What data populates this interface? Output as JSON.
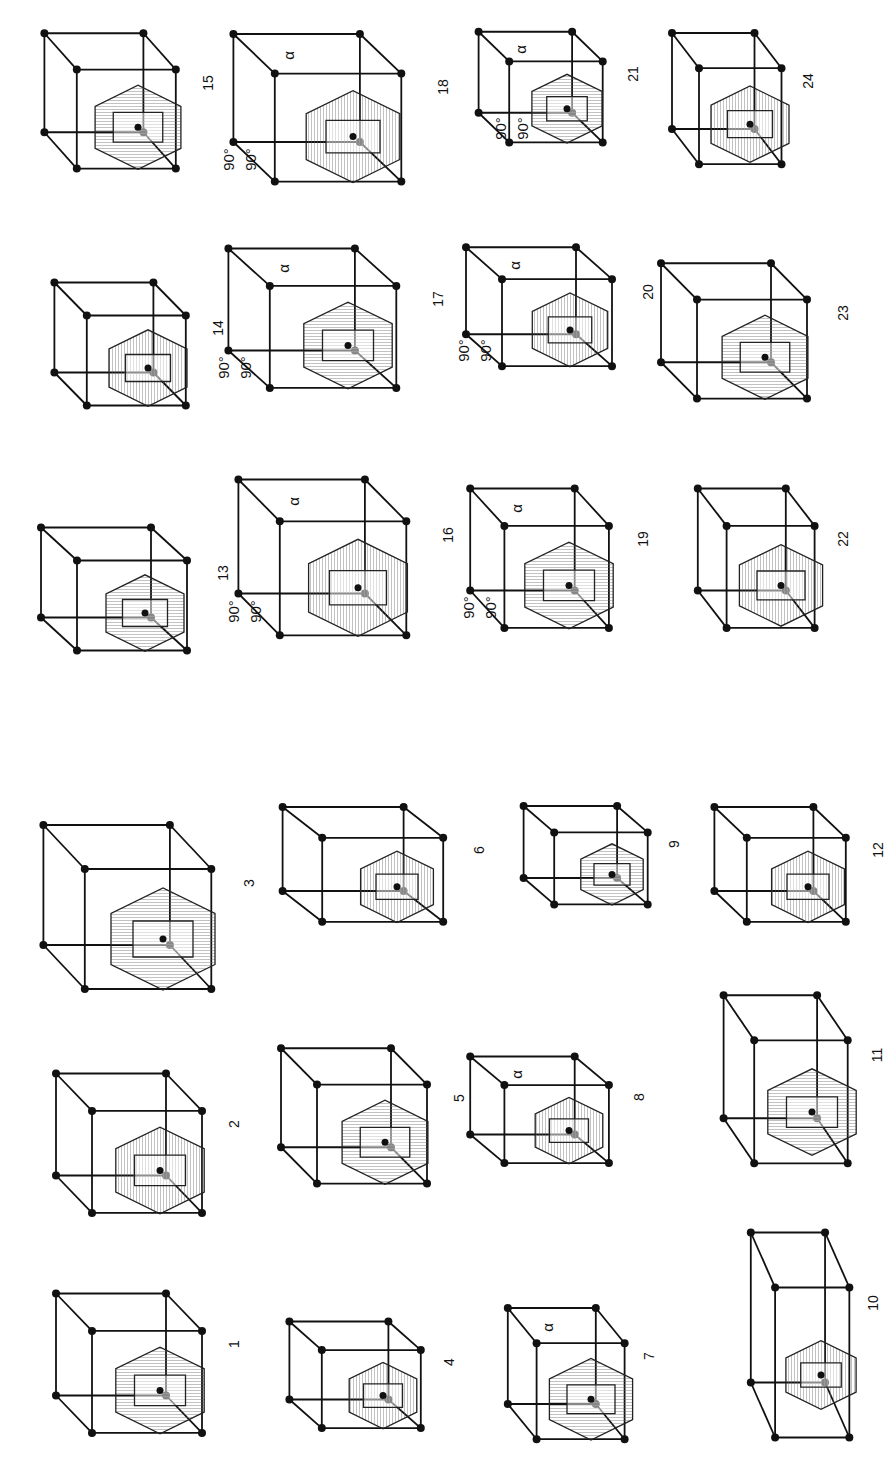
{
  "figure": {
    "orientation": "rotated 90 degrees counter-clockwise",
    "panels": [
      {
        "id": "1",
        "label": "1",
        "x": 40,
        "y": 1285,
        "w": 200,
        "h": 170,
        "kind": "cubic-bcc-truncated-octahedron",
        "angles": []
      },
      {
        "id": "2",
        "label": "2",
        "x": 40,
        "y": 1065,
        "w": 200,
        "h": 170,
        "kind": "cubic-fcc-rhombic-dodecahedron",
        "angles": []
      },
      {
        "id": "3",
        "label": "3",
        "x": 25,
        "y": 815,
        "w": 230,
        "h": 200,
        "kind": "cubic-primitive-cube",
        "angles": []
      },
      {
        "id": "4",
        "label": "4",
        "x": 275,
        "y": 1315,
        "w": 180,
        "h": 130,
        "kind": "tetragonal-primitive",
        "angles": []
      },
      {
        "id": "5",
        "label": "5",
        "x": 265,
        "y": 1040,
        "w": 200,
        "h": 165,
        "kind": "tetragonal-body-centered",
        "angles": []
      },
      {
        "id": "6",
        "label": "6",
        "x": 265,
        "y": 800,
        "w": 220,
        "h": 140,
        "kind": "hexagonal-centered",
        "angles": []
      },
      {
        "id": "7",
        "label": "7",
        "x": 495,
        "y": 1300,
        "w": 160,
        "h": 160,
        "kind": "rhombohedral",
        "angles": [
          "α"
        ]
      },
      {
        "id": "8",
        "label": "8",
        "x": 455,
        "y": 1050,
        "w": 190,
        "h": 130,
        "kind": "rhombohedral-primitive",
        "angles": [
          "α"
        ]
      },
      {
        "id": "9",
        "label": "9",
        "x": 510,
        "y": 800,
        "w": 170,
        "h": 120,
        "kind": "hexagonal-primitive",
        "angles": []
      },
      {
        "id": "10",
        "label": "10",
        "x": 740,
        "y": 1220,
        "w": 135,
        "h": 250,
        "kind": "orthorhombic-face-centered",
        "angles": []
      },
      {
        "id": "11",
        "label": "11",
        "x": 710,
        "y": 985,
        "w": 170,
        "h": 205,
        "kind": "orthorhombic-body-centered",
        "angles": []
      },
      {
        "id": "12",
        "label": "12",
        "x": 700,
        "y": 800,
        "w": 180,
        "h": 140,
        "kind": "orthorhombic-base-centered",
        "angles": []
      },
      {
        "id": "13",
        "label": "13",
        "x": 25,
        "y": 520,
        "w": 200,
        "h": 150,
        "kind": "orthorhombic-dodecahedron",
        "angles": []
      },
      {
        "id": "14",
        "label": "14",
        "x": 40,
        "y": 275,
        "w": 180,
        "h": 150,
        "kind": "orthorhombic-primitive",
        "angles": []
      },
      {
        "id": "15",
        "label": "15",
        "x": 30,
        "y": 25,
        "w": 180,
        "h": 165,
        "kind": "orthorhombic-brick",
        "angles": []
      },
      {
        "id": "16",
        "label": "16",
        "x": 220,
        "y": 470,
        "w": 230,
        "h": 190,
        "kind": "monoclinic-base-centered",
        "angles": [
          "90°",
          "90°",
          "α"
        ]
      },
      {
        "id": "17",
        "label": "17",
        "x": 210,
        "y": 240,
        "w": 230,
        "h": 170,
        "kind": "monoclinic-face",
        "angles": [
          "90°",
          "90°",
          "α"
        ]
      },
      {
        "id": "18",
        "label": "18",
        "x": 215,
        "y": 25,
        "w": 230,
        "h": 180,
        "kind": "monoclinic-primitive",
        "angles": [
          "90°",
          "90°",
          "α"
        ]
      },
      {
        "id": "19",
        "label": "19",
        "x": 455,
        "y": 480,
        "w": 190,
        "h": 170,
        "kind": "monoclinic-centered",
        "angles": [
          "90°",
          "90°",
          "α"
        ]
      },
      {
        "id": "20",
        "label": "20",
        "x": 450,
        "y": 240,
        "w": 200,
        "h": 145,
        "kind": "monoclinic-centered-2",
        "angles": [
          "90°",
          "90°",
          "α"
        ]
      },
      {
        "id": "21",
        "label": "21",
        "x": 465,
        "y": 25,
        "w": 170,
        "h": 135,
        "kind": "triclinic",
        "angles": [
          "α",
          "90°",
          "90°"
        ]
      },
      {
        "id": "22",
        "label": "22",
        "x": 685,
        "y": 480,
        "w": 160,
        "h": 170,
        "kind": "cubic-truncated-with-axes",
        "angles": []
      },
      {
        "id": "23",
        "label": "23",
        "x": 645,
        "y": 255,
        "w": 200,
        "h": 165,
        "kind": "tetragonal-with-axes",
        "angles": []
      },
      {
        "id": "24",
        "label": "24",
        "x": 660,
        "y": 25,
        "w": 150,
        "h": 160,
        "kind": "hexagonal-with-axes",
        "angles": []
      }
    ]
  },
  "colors": {
    "ink": "#111111",
    "background": "#ffffff",
    "hatch": "#555555"
  }
}
